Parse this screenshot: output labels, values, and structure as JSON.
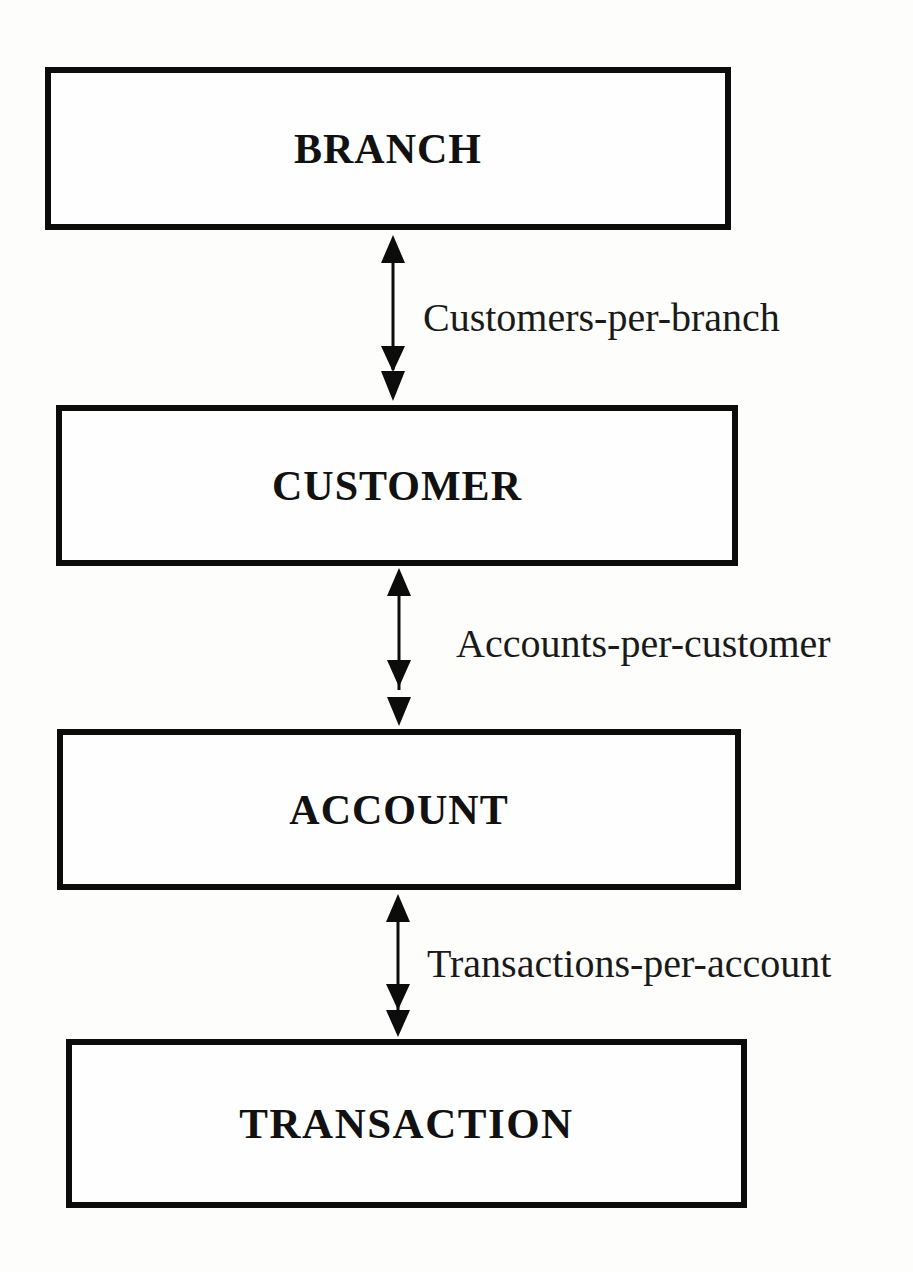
{
  "diagram": {
    "type": "entity-relationship hierarchy",
    "entities": [
      {
        "id": "branch",
        "label": "BRANCH",
        "box": {
          "left": 45,
          "top": 67,
          "width": 686,
          "height": 163
        },
        "title_y": 152
      },
      {
        "id": "customer",
        "label": "CUSTOMER",
        "box": {
          "left": 56,
          "top": 405,
          "width": 682,
          "height": 161
        },
        "title_y": 487
      },
      {
        "id": "account",
        "label": "ACCOUNT",
        "box": {
          "left": 57,
          "top": 729,
          "width": 684,
          "height": 161
        },
        "title_y": 810
      },
      {
        "id": "transaction",
        "label": "TRANSACTION",
        "box": {
          "left": 66,
          "top": 1039,
          "width": 681,
          "height": 169
        },
        "title_y": 1127
      }
    ],
    "relationships": [
      {
        "id": "customers-per-branch",
        "from": "branch",
        "to": "customer",
        "label": "Customers-per-branch",
        "cardinality": "one-to-many",
        "label_pos": {
          "left": 423,
          "top": 299
        }
      },
      {
        "id": "accounts-per-customer",
        "from": "customer",
        "to": "account",
        "label": "Accounts-per-customer",
        "cardinality": "one-to-many",
        "label_pos": {
          "left": 456,
          "top": 624
        }
      },
      {
        "id": "transactions-per-account",
        "from": "account",
        "to": "transaction",
        "label": "Transactions-per-account",
        "cardinality": "one-to-many",
        "label_pos": {
          "left": 427,
          "top": 944
        }
      }
    ],
    "colors": {
      "line": "#0c0c0c",
      "text": "#111111",
      "background": "#fdfdfb"
    }
  }
}
